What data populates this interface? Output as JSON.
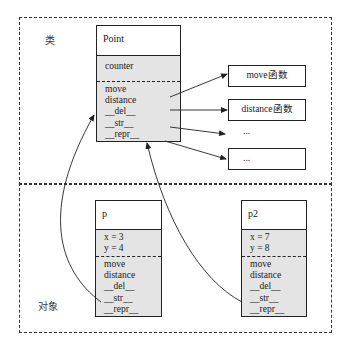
{
  "labels": {
    "class_region": "类",
    "object_region": "对象"
  },
  "class_box": {
    "name": "Point",
    "attributes": [
      "counter"
    ],
    "methods": [
      "move",
      "distance",
      "__del__",
      "__str__",
      "__repr__"
    ]
  },
  "function_boxes": [
    {
      "label": "move函数",
      "boxed": true
    },
    {
      "label": "distance函数",
      "boxed": true
    },
    {
      "label": "...",
      "boxed": false
    },
    {
      "label": "...",
      "boxed": true
    }
  ],
  "objects": [
    {
      "name": "p",
      "attributes": [
        "x = 3",
        "y = 4"
      ],
      "methods": [
        "move",
        "distance",
        "__del__",
        "__str__",
        "__repr__"
      ]
    },
    {
      "name": "p2",
      "attributes": [
        "x = 7",
        "y = 8"
      ],
      "methods": [
        "move",
        "distance",
        "__del__",
        "__str__",
        "__repr__"
      ]
    }
  ],
  "colors": {
    "fill": "#e4e4e4",
    "line": "#222222"
  }
}
